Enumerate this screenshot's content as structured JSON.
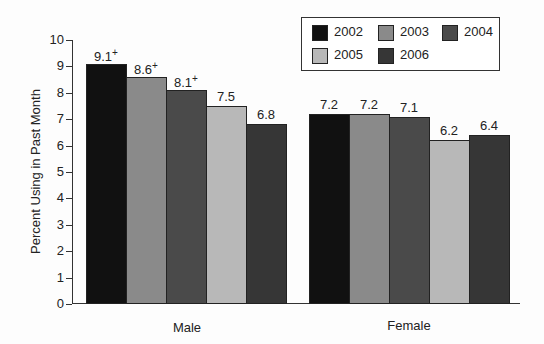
{
  "chart_data": {
    "type": "bar",
    "title": "",
    "xlabel": "",
    "ylabel": "Percent Using in Past Month",
    "ylim": [
      0,
      10
    ],
    "yticks": [
      0,
      1,
      2,
      3,
      4,
      5,
      6,
      7,
      8,
      9,
      10
    ],
    "categories": [
      "Male",
      "Female"
    ],
    "series": [
      {
        "name": "2002",
        "color": "#111111",
        "values": [
          9.1,
          7.2
        ],
        "labels": [
          "9.1+",
          "7.2"
        ]
      },
      {
        "name": "2003",
        "color": "#8a8a8a",
        "values": [
          8.6,
          7.2
        ],
        "labels": [
          "8.6+",
          "7.2"
        ]
      },
      {
        "name": "2004",
        "color": "#4a4a4a",
        "values": [
          8.1,
          7.1
        ],
        "labels": [
          "8.1+",
          "7.1"
        ]
      },
      {
        "name": "2005",
        "color": "#b8b8b8",
        "values": [
          7.5,
          6.2
        ],
        "labels": [
          "7.5",
          "6.2"
        ]
      },
      {
        "name": "2006",
        "color": "#363636",
        "values": [
          6.8,
          6.4
        ],
        "labels": [
          "6.8",
          "6.4"
        ]
      }
    ],
    "legend_position": "top-right",
    "grid": false
  }
}
